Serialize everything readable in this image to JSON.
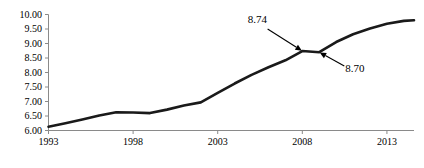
{
  "chart_data": {
    "type": "line",
    "title": "",
    "subtitle": "",
    "xlabel": "",
    "ylabel": "",
    "xlim": [
      1993,
      2014.6
    ],
    "ylim": [
      6.0,
      10.0
    ],
    "grid": false,
    "legend": "none",
    "x_tick_labels": [
      "1993",
      "1998",
      "2003",
      "2008",
      "2013"
    ],
    "x_tick_values": [
      1993,
      1998,
      2003,
      2008,
      2013
    ],
    "y_tick_labels": [
      "10.00",
      "9.50",
      "9.00",
      "8.50",
      "8.00",
      "7.50",
      "7.00",
      "6.50",
      "6.00"
    ],
    "y_tick_values": [
      10.0,
      9.5,
      9.0,
      8.5,
      8.0,
      7.5,
      7.0,
      6.5,
      6.0
    ],
    "series": [
      {
        "name": "value",
        "x": [
          1993,
          1994,
          1995,
          1996,
          1997,
          1998,
          1999,
          2000,
          2001,
          2002,
          2003,
          2004,
          2005,
          2006,
          2007,
          2008,
          2009,
          2010,
          2011,
          2012,
          2013,
          2014,
          2014.6
        ],
        "values": [
          6.13,
          6.25,
          6.38,
          6.52,
          6.63,
          6.62,
          6.6,
          6.72,
          6.86,
          6.97,
          7.3,
          7.62,
          7.92,
          8.18,
          8.42,
          8.74,
          8.7,
          9.05,
          9.32,
          9.52,
          9.68,
          9.78,
          9.8
        ]
      }
    ],
    "annotations": [
      {
        "label": "8.74",
        "point_x": 2008,
        "point_y": 8.74,
        "label_x": 2005.35,
        "label_y": 9.72
      },
      {
        "label": "8.70",
        "point_x": 2009,
        "point_y": 8.7,
        "label_x": 2011.1,
        "label_y": 8.02
      }
    ],
    "colors": {
      "line": "#1a1a1a",
      "axis": "#8a8a8a",
      "text": "#000000",
      "background": "#ffffff"
    }
  }
}
